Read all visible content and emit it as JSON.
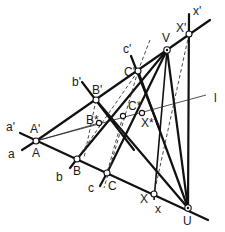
{
  "figure": {
    "labels": {
      "a_prime": "a'",
      "a": "a",
      "A_prime": "A'",
      "A": "A",
      "b_prime": "b'",
      "B_prime": "B'",
      "B_star": "B*",
      "b": "b",
      "B": "B",
      "c_prime": "c'",
      "C_prime": "C'",
      "C_star": "C*",
      "c": "c",
      "C": "C",
      "V": "V",
      "x_prime": "x'",
      "X_prime": "X'",
      "X_star": "X*",
      "X": "X",
      "x": "x",
      "U": "U",
      "l": "l"
    },
    "points": {
      "A": [
        36,
        141
      ],
      "B": [
        77,
        159
      ],
      "C": [
        107,
        173
      ],
      "X": [
        154,
        194
      ],
      "U": [
        188,
        208
      ],
      "B_prime": [
        96,
        100
      ],
      "C_prime": [
        138,
        71
      ],
      "V": [
        167,
        50
      ],
      "X_prime": [
        189,
        34
      ],
      "B_star": [
        99,
        123
      ],
      "C_star": [
        123,
        116
      ],
      "X_star": [
        142,
        113
      ]
    },
    "colors": {
      "line": "#111111",
      "background": "#ffffff"
    }
  }
}
